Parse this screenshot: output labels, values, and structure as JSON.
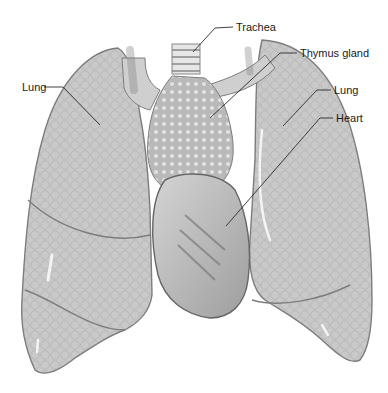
{
  "figure": {
    "colors": {
      "background": "#ffffff",
      "lung_fill": "#c9c9c9",
      "lung_edge": "#8a8a8a",
      "heart_fill": "#b8b8b8",
      "thymus_fill": "#bdbdbd",
      "leader_line": "#2a2a2a",
      "label_text": "#1a1a1a"
    }
  },
  "labels": {
    "trachea": "Trachea",
    "thymus": "Thymus gland",
    "lung_left": "Lung",
    "lung_right": "Lung",
    "heart": "Heart"
  }
}
